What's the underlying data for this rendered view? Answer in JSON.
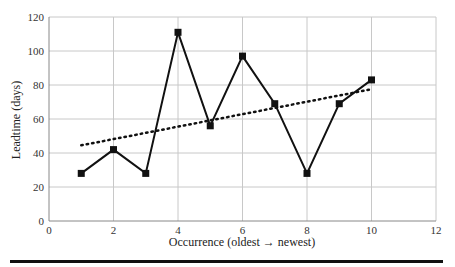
{
  "chart_data": {
    "type": "line",
    "title": "",
    "xlabel": "Occurrence (oldest → newest)",
    "ylabel": "Leadtime (days)",
    "xlim": [
      0,
      12
    ],
    "ylim": [
      0,
      120
    ],
    "x_ticks": [
      0,
      2,
      4,
      6,
      8,
      10,
      12
    ],
    "y_ticks": [
      0,
      20,
      40,
      60,
      80,
      100,
      120
    ],
    "grid": true,
    "legend": null,
    "x": [
      1,
      2,
      3,
      4,
      5,
      6,
      7,
      8,
      9,
      10
    ],
    "series": [
      {
        "name": "Leadtime",
        "style": "solid line with square markers",
        "color": "#111111",
        "values": [
          28,
          42,
          28,
          111,
          56,
          97,
          69,
          28,
          69,
          83
        ]
      },
      {
        "name": "Linear trend",
        "style": "dotted",
        "color": "#111111",
        "x": [
          1,
          10
        ],
        "values": [
          44.5,
          77.5
        ]
      }
    ]
  }
}
